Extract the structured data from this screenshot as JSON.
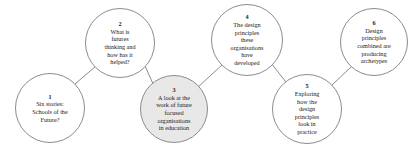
{
  "diagram": {
    "type": "flow-sequence",
    "background_color": "#ffffff",
    "node_stroke_color": "#8c8c8c",
    "node_fill_color": "#ffffff",
    "highlight_fill_color": "#e8e8e8",
    "connector_color": "#8c8c8c",
    "nodes": [
      {
        "number": "1",
        "lines": [
          "Six stories:",
          "Schools of the",
          "Future?"
        ],
        "highlighted": false,
        "cx": 50,
        "cy": 108,
        "r": 35
      },
      {
        "number": "2",
        "lines": [
          "What is",
          "futures",
          "thinking and",
          "how has it",
          "helped?"
        ],
        "highlighted": false,
        "cx": 120,
        "cy": 43,
        "r": 35
      },
      {
        "number": "3",
        "lines": [
          "A look at the",
          "work of future",
          "focused",
          "organisations",
          "in education"
        ],
        "highlighted": true,
        "cx": 174,
        "cy": 109,
        "r": 34
      },
      {
        "number": "4",
        "lines": [
          "The design",
          "principles",
          "these",
          "organisations",
          "have",
          "developed"
        ],
        "highlighted": false,
        "cx": 247,
        "cy": 40,
        "r": 36
      },
      {
        "number": "5",
        "lines": [
          "Exploring",
          "how the",
          "design",
          "principles",
          "look in",
          "practice"
        ],
        "highlighted": false,
        "cx": 307,
        "cy": 109,
        "r": 35
      },
      {
        "number": "6",
        "lines": [
          "Design",
          "principles",
          "combined are",
          "producing",
          "archetypes"
        ],
        "highlighted": false,
        "cx": 374,
        "cy": 42,
        "r": 34
      }
    ],
    "connectors": [
      {
        "from": "1",
        "to": "2",
        "x1": 75,
        "y1": 84,
        "x2": 96,
        "y2": 66
      },
      {
        "from": "2",
        "to": "3",
        "x1": 145,
        "y1": 66,
        "x2": 154,
        "y2": 86
      },
      {
        "from": "3",
        "to": "4",
        "x1": 197,
        "y1": 88,
        "x2": 223,
        "y2": 64
      },
      {
        "from": "4",
        "to": "5",
        "x1": 271,
        "y1": 63,
        "x2": 289,
        "y2": 86
      },
      {
        "from": "5",
        "to": "6",
        "x1": 330,
        "y1": 87,
        "x2": 352,
        "y2": 66
      }
    ]
  }
}
